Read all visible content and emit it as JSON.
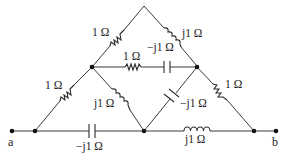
{
  "diagram": {
    "type": "circuit",
    "terminals": [
      {
        "id": "a",
        "label": "a"
      },
      {
        "id": "b",
        "label": "b"
      }
    ],
    "components": [
      {
        "id": "R_upper_left",
        "kind": "resistor",
        "label": "1 Ω"
      },
      {
        "id": "L_upper_right",
        "kind": "inductor",
        "label": "j1 Ω"
      },
      {
        "id": "R_middle",
        "kind": "resistor",
        "label": "1 Ω"
      },
      {
        "id": "C_middle",
        "kind": "capacitor",
        "label": "−j1 Ω"
      },
      {
        "id": "R_lower_left",
        "kind": "resistor",
        "label": "1 Ω"
      },
      {
        "id": "L_inner_left",
        "kind": "inductor",
        "label": "j1 Ω"
      },
      {
        "id": "C_inner_right",
        "kind": "capacitor",
        "label": "−j1 Ω"
      },
      {
        "id": "R_right",
        "kind": "resistor",
        "label": "1 Ω"
      },
      {
        "id": "C_bottom",
        "kind": "capacitor",
        "label": "−j1 Ω"
      },
      {
        "id": "L_bottom",
        "kind": "inductor",
        "label": "j1 Ω"
      }
    ]
  }
}
